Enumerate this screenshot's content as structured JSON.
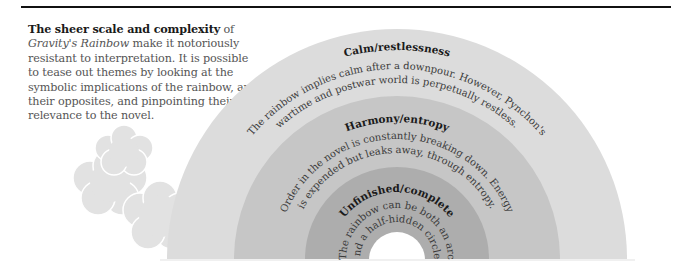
{
  "intro": {
    "lead_bold": "The sheer scale and complexity",
    "lead_rest": " of",
    "title_italic": "Gravity's Rainbow",
    "body": " make it notoriously resistant to interpretation. It is possible to tease out themes by looking at the symbolic implications of the rainbow, and their opposites, and pinpointing their relevance to the novel."
  },
  "rainbow": {
    "colors": {
      "outer": "#dcdcdc",
      "middle": "#c6c6c6",
      "inner": "#adadad",
      "hole": "#ffffff",
      "cloud": "#e2e2e2"
    },
    "bands": [
      {
        "heading": "Calm/restlessness",
        "line1": "The rainbow implies calm after a downpour. However, Pynchon's",
        "line2": "wartime and postwar world is perpetually restless."
      },
      {
        "heading": "Harmony/entropy",
        "line1": "Order in the novel is constantly breaking down. Energy",
        "line2": "is expended but leaks away, through entropy."
      },
      {
        "heading": "Unfinished/complete",
        "line1": "The rainbow can be both an arc",
        "line2": "and a half-hidden circle."
      }
    ]
  }
}
